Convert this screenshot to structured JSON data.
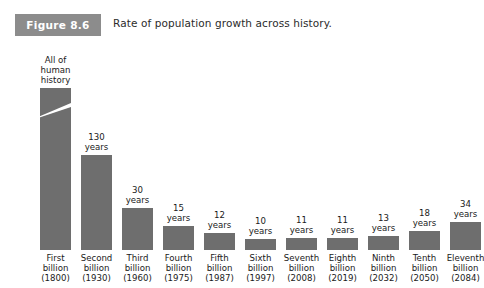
{
  "figure": {
    "badge_label": "Figure 8.6",
    "caption": "Rate of population growth across history.",
    "badge_color": "#8c8c8c",
    "bar_color": "#6e6e6e",
    "background_color": "#ffffff"
  },
  "chart_data": {
    "type": "bar",
    "title": "Rate of population growth across history.",
    "xlabel": "",
    "ylabel": "",
    "grid": false,
    "legend": null,
    "axis_break": {
      "present": true,
      "series_index": 0,
      "note": "First bar is drawn with a broken (truncated) axis slash because its value dwarfs the others."
    },
    "categories": [
      "First billion (1800)",
      "Second billion (1930)",
      "Third billion (1960)",
      "Fourth billion (1975)",
      "Fifth billion (1987)",
      "Sixth billion (1997)",
      "Seventh billion (2008)",
      "Eighth billion (2019)",
      "Ninth billion (2032)",
      "Tenth billion (2050)",
      "Eleventh billion (2084)"
    ],
    "values": [
      null,
      130,
      30,
      15,
      12,
      10,
      11,
      11,
      13,
      18,
      34
    ],
    "value_labels": [
      "All of human history",
      "130 years",
      "30 years",
      "15 years",
      "12 years",
      "10 years",
      "11 years",
      "11 years",
      "13 years",
      "18 years",
      "34 years"
    ],
    "bars": [
      {
        "label_lines": [
          "All of",
          "human",
          "history"
        ],
        "years": null,
        "broken": true,
        "bar_px": 162,
        "cat_lines": [
          "First",
          "billion",
          "(1800)"
        ]
      },
      {
        "label_lines": [
          "130",
          "years"
        ],
        "years": 130,
        "broken": false,
        "bar_px": 95,
        "cat_lines": [
          "Second",
          "billion",
          "(1930)"
        ]
      },
      {
        "label_lines": [
          "30",
          "years"
        ],
        "years": 30,
        "broken": false,
        "bar_px": 42,
        "cat_lines": [
          "Third",
          "billion",
          "(1960)"
        ]
      },
      {
        "label_lines": [
          "15",
          "years"
        ],
        "years": 15,
        "broken": false,
        "bar_px": 24,
        "cat_lines": [
          "Fourth",
          "billion",
          "(1975)"
        ]
      },
      {
        "label_lines": [
          "12",
          "years"
        ],
        "years": 12,
        "broken": false,
        "bar_px": 17,
        "cat_lines": [
          "Fifth",
          "billion",
          "(1987)"
        ]
      },
      {
        "label_lines": [
          "10",
          "years"
        ],
        "years": 10,
        "broken": false,
        "bar_px": 11,
        "cat_lines": [
          "Sixth",
          "billion",
          "(1997)"
        ]
      },
      {
        "label_lines": [
          "11",
          "years"
        ],
        "years": 11,
        "broken": false,
        "bar_px": 12,
        "cat_lines": [
          "Seventh",
          "billion",
          "(2008)"
        ]
      },
      {
        "label_lines": [
          "11",
          "years"
        ],
        "years": 11,
        "broken": false,
        "bar_px": 12,
        "cat_lines": [
          "Eighth",
          "billion",
          "(2019)"
        ]
      },
      {
        "label_lines": [
          "13",
          "years"
        ],
        "years": 13,
        "broken": false,
        "bar_px": 14,
        "cat_lines": [
          "Ninth",
          "billion",
          "(2032)"
        ]
      },
      {
        "label_lines": [
          "18",
          "years"
        ],
        "years": 18,
        "broken": false,
        "bar_px": 19,
        "cat_lines": [
          "Tenth",
          "billion",
          "(2050)"
        ]
      },
      {
        "label_lines": [
          "34",
          "years"
        ],
        "years": 34,
        "broken": false,
        "bar_px": 28,
        "cat_lines": [
          "Eleventh",
          "billion",
          "(2084)"
        ]
      }
    ]
  },
  "layout": {
    "first_bar_left": 40,
    "bar_width": 31,
    "bar_pitch": 41
  }
}
